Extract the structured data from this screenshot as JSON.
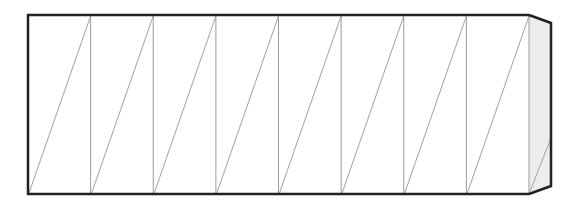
{
  "diagram": {
    "type": "segmented-prism",
    "segments": 8,
    "box": {
      "x": 28,
      "y": 15,
      "width": 501,
      "height": 179
    },
    "end_cap": {
      "top_right_y": 23,
      "bottom_right_y": 186,
      "depth": 22,
      "diagonal_top_y": 138
    },
    "colors": {
      "outline": "#222222",
      "divider": "#9a9a9a",
      "diagonal": "#a0a0a0",
      "cap_fill": "#ededed",
      "background": "#ffffff"
    }
  }
}
